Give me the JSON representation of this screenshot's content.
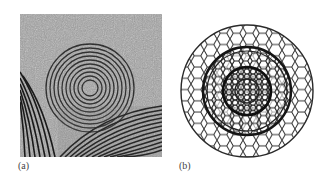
{
  "figure": {
    "panels": [
      {
        "id": "a",
        "label": "(a)",
        "description": "TEM micrograph showing concentric onion-like graphitic shells surrounded by layered lattice fringes on a noisy background"
      },
      {
        "id": "b",
        "label": "(b)",
        "description": "Wireframe model of nested spherical fullerene shells (carbon onion) with hexagonal network"
      }
    ],
    "colors": {
      "background": "#ffffff",
      "micrograph_bg": "#9a9a9a",
      "fringe": "#1e1e1e",
      "wireframe": "#2a2a2a",
      "label": "#444444"
    }
  }
}
